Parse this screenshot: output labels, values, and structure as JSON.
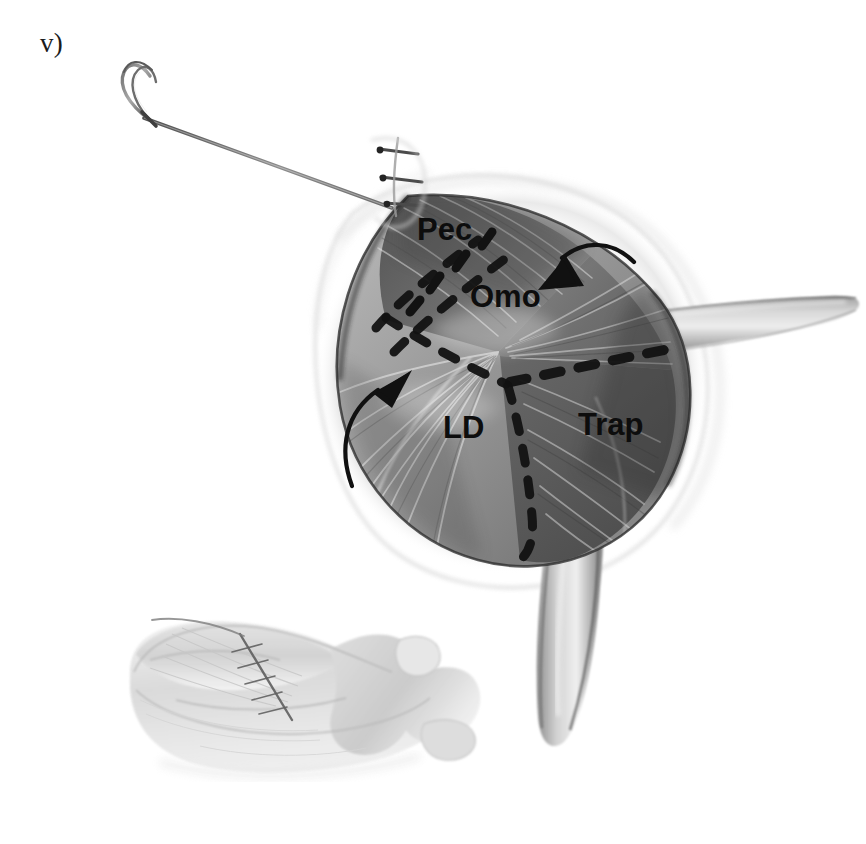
{
  "figure": {
    "panel_letter": "v)",
    "background_color": "#ffffff",
    "ink_color": "#0d0d0d",
    "width": 866,
    "height": 844
  },
  "labels": {
    "pec": "Pec",
    "omo": "Omo",
    "ld": "LD",
    "trap": "Trap"
  },
  "instruments": {
    "needle_name": "curved-surgical-needle",
    "suture_thread_name": "suture-thread",
    "knot_stitches_count": 3,
    "thread_color": "#707070"
  },
  "annotations": {
    "arrow_upper_right": {
      "name": "arrow-omo",
      "direction": "down-left",
      "points_to": "Omo"
    },
    "arrow_lower_left": {
      "name": "arrow-ld",
      "direction": "up-right",
      "points_to": "LD"
    }
  },
  "suture_lines": {
    "name": "dashed-suture-lines",
    "pattern": "Y-shaped three-limb dashed closure",
    "color": "#121212",
    "limbs": [
      "upper-left diagonal limb separating Pec from Omo",
      "horizontal right limb separating Omo from Trap",
      "lower vertical limb separating LD from Trap"
    ]
  },
  "inset": {
    "name": "whole-animal-orientation-sketch",
    "description": "Faint pencil sketch of quadruped in lateral recumbency showing sutured surgical site on the shoulder",
    "tone": "#b8b8b8"
  }
}
